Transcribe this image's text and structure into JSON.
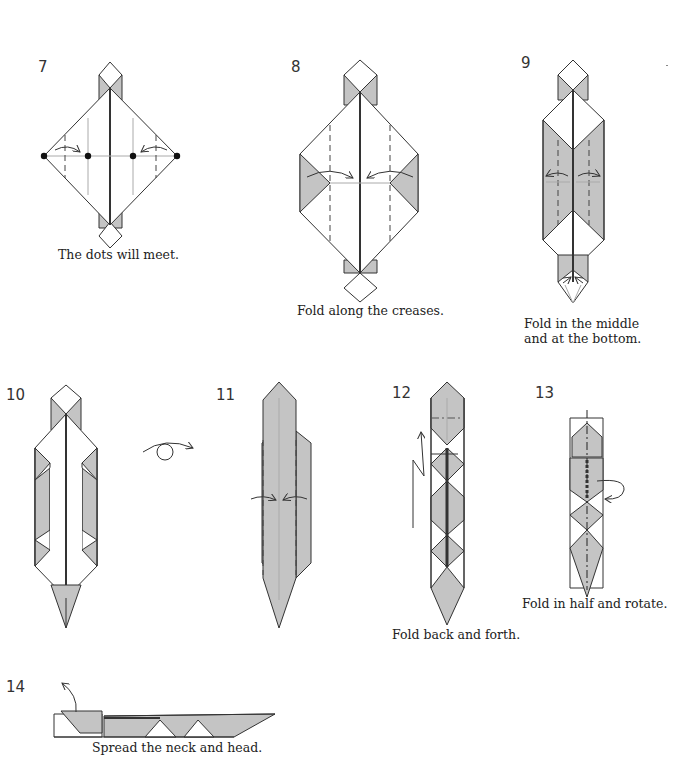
{
  "diagram": {
    "type": "origami-instructions",
    "colors": {
      "paper_white": "#ffffff",
      "paper_gray": "#c4c4c4",
      "line": "#333333",
      "crease": "#aaaaaa"
    },
    "steps": [
      {
        "number": "7",
        "caption": "The dots will meet.",
        "dots": 4,
        "arrows": [
          "valley-fold-right",
          "valley-fold-left"
        ]
      },
      {
        "number": "8",
        "caption": "Fold along the creases.",
        "arrows": [
          "valley-fold-right",
          "valley-fold-left"
        ]
      },
      {
        "number": "9",
        "caption_lines": [
          "Fold in the middle",
          "and at the bottom."
        ],
        "arrows": [
          "fold-left",
          "fold-right",
          "squash-bottom"
        ]
      },
      {
        "number": "10",
        "caption": "",
        "symbol": "turn-over"
      },
      {
        "number": "11",
        "caption": "",
        "arrows": [
          "valley-fold-right",
          "valley-fold-left"
        ]
      },
      {
        "number": "12",
        "caption": "Fold back and forth.",
        "symbol": "pleat-arrow"
      },
      {
        "number": "13",
        "caption": "Fold in half and rotate.",
        "symbol": "fold-and-rotate-arrow"
      },
      {
        "number": "14",
        "caption": "Spread the neck and head.",
        "symbol": "open-arrow"
      }
    ]
  }
}
